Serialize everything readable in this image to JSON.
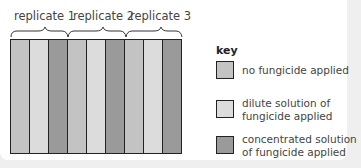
{
  "colors": {
    "none": "#c3c3c3",
    "dilute": "#dcdcdc",
    "concentrated": "#9a9a9a",
    "outline": "#222222"
  },
  "replicates": [
    {
      "label": "replicate 1",
      "strips": [
        "none",
        "dilute",
        "concentrated"
      ]
    },
    {
      "label": "replicate 2",
      "strips": [
        "none",
        "dilute",
        "concentrated"
      ]
    },
    {
      "label": "replicate 3",
      "strips": [
        "none",
        "dilute",
        "concentrated"
      ]
    }
  ],
  "key": {
    "title": "key",
    "items": [
      {
        "id": "none",
        "text": "no fungicide applied"
      },
      {
        "id": "dilute",
        "text": "dilute solution of fungicide applied"
      },
      {
        "id": "concentrated",
        "text": "concentrated solution of fungicide applied"
      }
    ]
  }
}
